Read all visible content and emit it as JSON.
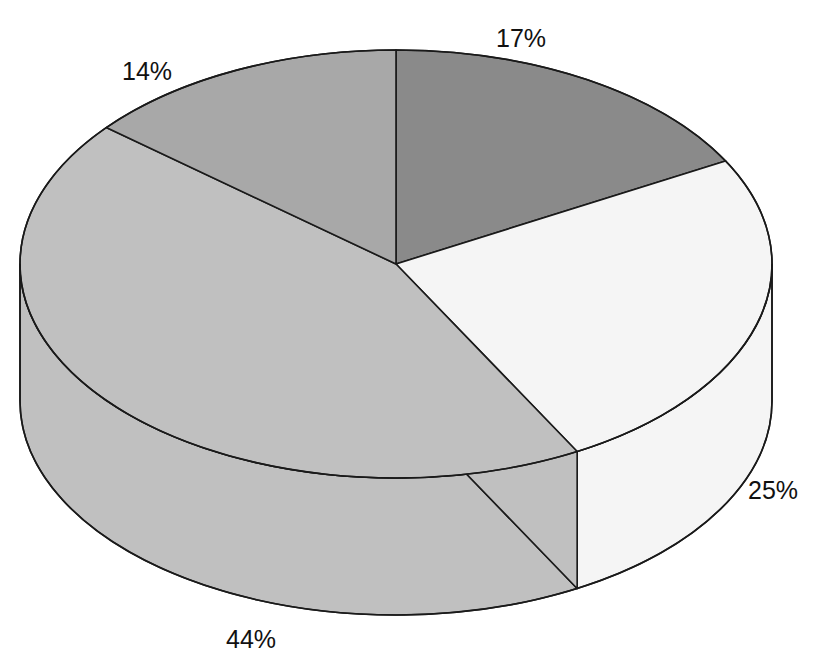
{
  "chart_data": {
    "type": "pie",
    "title": "",
    "title_clipped": true,
    "subtitle": "",
    "xlabel": "",
    "ylabel": "",
    "legend": [],
    "legend_position": "none",
    "grid": false,
    "three_d": true,
    "labels_show_percent": true,
    "categories": [
      "Slice 1",
      "Slice 2",
      "Slice 3",
      "Slice 4"
    ],
    "values": [
      17,
      25,
      44,
      14
    ],
    "value_labels": [
      "17%",
      "25%",
      "44%",
      "14%"
    ],
    "colors": [
      "#8a8a8a",
      "#f5f5f5",
      "#c0c0c0",
      "#a8a8a8"
    ],
    "slices": [
      {
        "label": "17%",
        "value": 17,
        "fill": "#8a8a8a",
        "side_fill": "#6e6e6e",
        "start_angle_deg": -90.0,
        "end_angle_deg": -28.8,
        "label_x": 496,
        "label_y": 26
      },
      {
        "label": "25%",
        "value": 25,
        "fill": "#f5f5f5",
        "side_fill": "#eaeaea",
        "start_angle_deg": -28.8,
        "end_angle_deg": 61.2,
        "label_x": 748,
        "label_y": 478
      },
      {
        "label": "44%",
        "value": 44,
        "fill": "#c0c0c0",
        "side_fill": "#b4b4b4",
        "start_angle_deg": 61.2,
        "end_angle_deg": 219.6,
        "label_x": 226,
        "label_y": 627
      },
      {
        "label": "14%",
        "value": 14,
        "fill": "#a8a8a8",
        "side_fill": "#9a9a9a",
        "start_angle_deg": 219.6,
        "end_angle_deg": 270.0,
        "label_x": 122,
        "label_y": 59
      }
    ],
    "geometry": {
      "center_x": 396,
      "center_y": 264,
      "radius_x": 376,
      "radius_y": 214,
      "depth": 137,
      "stroke": "#1a1a1a",
      "stroke_width": 1.6,
      "background": "#ffffff"
    }
  }
}
